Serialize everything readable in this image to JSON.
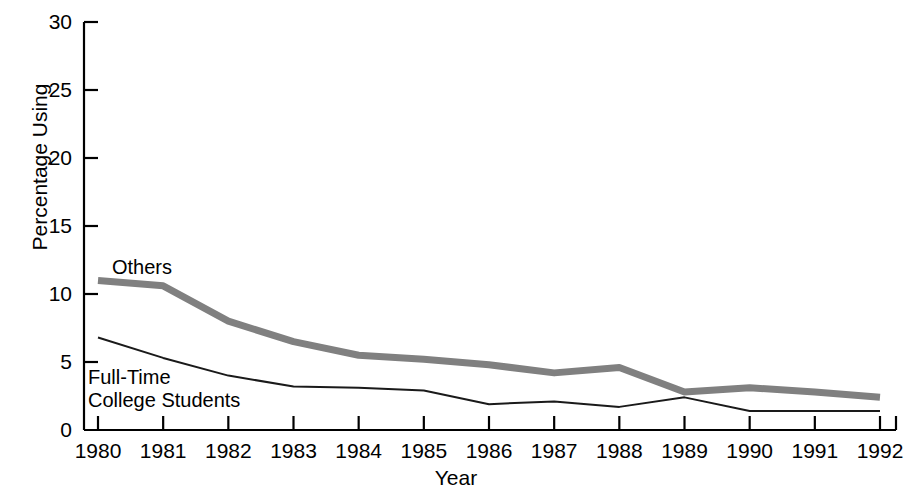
{
  "chart_data": {
    "type": "line",
    "title": "",
    "xlabel": "Year",
    "ylabel": "Percentage Using",
    "x": [
      1980,
      1981,
      1982,
      1983,
      1984,
      1985,
      1986,
      1987,
      1988,
      1989,
      1990,
      1991,
      1992
    ],
    "xtick_labels": [
      "1980",
      "1981",
      "1982",
      "1983",
      "1984",
      "1985",
      "1986",
      "1987",
      "1988",
      "1989",
      "1990",
      "1991",
      "1992"
    ],
    "ytick_labels": [
      "0",
      "5",
      "10",
      "15",
      "20",
      "25",
      "30"
    ],
    "yticks": [
      0,
      5,
      10,
      15,
      20,
      25,
      30
    ],
    "ylim": [
      0,
      30
    ],
    "xlim": [
      1980,
      1992
    ],
    "grid": false,
    "legend_position": "inline-annotations",
    "series": [
      {
        "name": "Others",
        "color": "#808080",
        "line_width": 7,
        "values": [
          11.0,
          10.6,
          8.0,
          6.5,
          5.5,
          5.2,
          4.8,
          4.2,
          4.6,
          2.8,
          3.1,
          2.8,
          2.4
        ]
      },
      {
        "name": "Full-Time College Students",
        "color": "#1a1a1a",
        "line_width": 2,
        "values": [
          6.8,
          5.3,
          4.0,
          3.2,
          3.1,
          2.9,
          1.9,
          2.1,
          1.7,
          2.4,
          1.4,
          1.4,
          1.4
        ]
      }
    ],
    "annotations": [
      {
        "text": "Others",
        "series": "Others"
      },
      {
        "text_line1": "Full-Time",
        "text_line2": "College Students",
        "series": "Full-Time College Students"
      }
    ]
  },
  "axes": {
    "y_title": "Percentage Using",
    "x_title": "Year"
  },
  "labels": {
    "others": "Others",
    "fulltime_line1": "Full-Time",
    "fulltime_line2": "College Students"
  }
}
